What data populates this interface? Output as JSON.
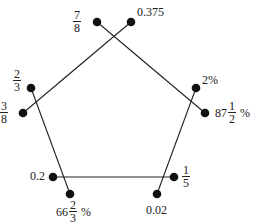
{
  "diagram": {
    "type": "pentagon-matching",
    "line_color": "#222222",
    "dot_color": "#111111",
    "nodes": {
      "n78": {
        "label": "7/8",
        "kind": "fraction",
        "num": "7",
        "den": "8"
      },
      "n0375": {
        "label": "0.375",
        "kind": "text",
        "text": "0.375"
      },
      "n23": {
        "label": "2/3",
        "kind": "fraction",
        "num": "2",
        "den": "3"
      },
      "n38": {
        "label": "3/8",
        "kind": "fraction",
        "num": "3",
        "den": "8"
      },
      "n2pct": {
        "label": "2%",
        "kind": "text",
        "text": "2%"
      },
      "n875pct": {
        "label": "87 1/2 %",
        "kind": "mixed",
        "whole": "87",
        "num": "1",
        "den": "2",
        "suffix": "%"
      },
      "n02": {
        "label": "0.2",
        "kind": "text",
        "text": "0.2"
      },
      "n15": {
        "label": "1/5",
        "kind": "fraction",
        "num": "1",
        "den": "5"
      },
      "n667pct": {
        "label": "66 2/3 %",
        "kind": "mixed",
        "whole": "66",
        "num": "2",
        "den": "3",
        "suffix": "%"
      },
      "n002": {
        "label": "0.02",
        "kind": "text",
        "text": "0.02"
      }
    },
    "edges": [
      {
        "from": "7/8",
        "to": "87 1/2 %"
      },
      {
        "from": "0.375",
        "to": "3/8"
      },
      {
        "from": "2/3",
        "to": "66 2/3 %"
      },
      {
        "from": "2%",
        "to": "0.02"
      },
      {
        "from": "0.2",
        "to": "1/5"
      }
    ]
  }
}
